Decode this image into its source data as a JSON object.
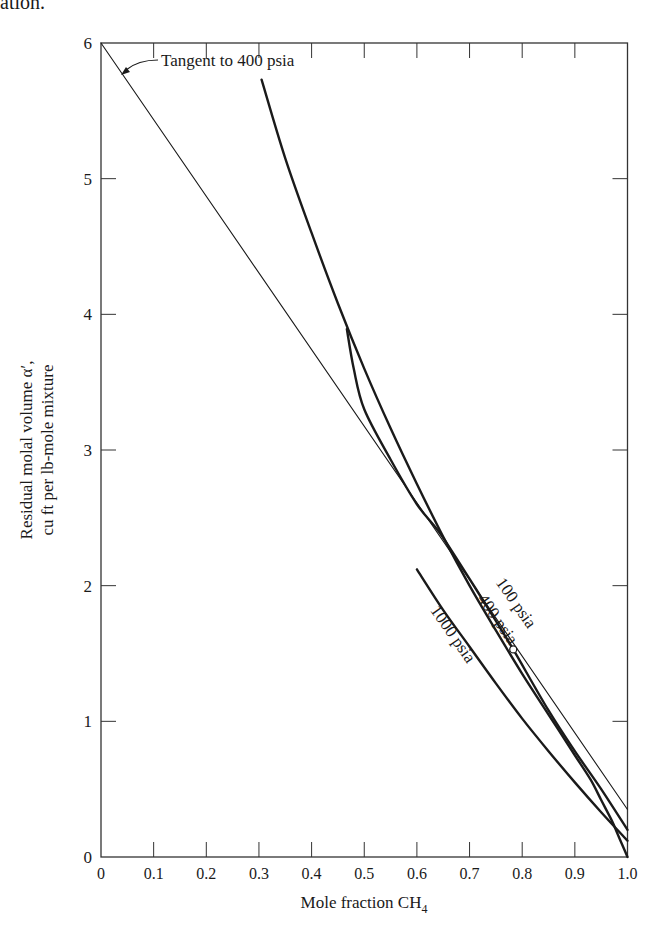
{
  "page": {
    "top_fragment": "ation.",
    "caption_partial": ""
  },
  "chart_data": {
    "type": "line",
    "title": "",
    "xlabel": "Mole fraction CH4",
    "xlabel_main": "Mole fraction CH",
    "xlabel_sub": "4",
    "ylabel": "Residual molal volume α′, cu ft per lb-mole mixture",
    "ylabel_line1": "Residual molal volume α′,",
    "ylabel_line2": "cu ft per lb-mole mixture",
    "xlim": [
      0,
      1.0
    ],
    "ylim": [
      0,
      6
    ],
    "grid": false,
    "legend": "none (curves labeled inline)",
    "x_ticks": [
      "0",
      "0.1",
      "0.2",
      "0.3",
      "0.4",
      "0.5",
      "0.6",
      "0.7",
      "0.8",
      "0.9",
      "1.0"
    ],
    "y_ticks": [
      "0",
      "1",
      "2",
      "3",
      "4",
      "5",
      "6"
    ],
    "series": [
      {
        "name": "100 psia",
        "x": [
          0.305,
          0.35,
          0.4,
          0.45,
          0.5,
          0.55,
          0.6,
          0.65,
          0.7,
          0.75,
          0.8,
          0.85,
          0.9,
          0.93,
          0.95,
          0.97,
          0.98,
          0.99,
          1.0
        ],
        "y": [
          5.73,
          5.15,
          4.6,
          4.08,
          3.6,
          3.16,
          2.75,
          2.36,
          2.0,
          1.67,
          1.35,
          1.05,
          0.75,
          0.57,
          0.42,
          0.27,
          0.18,
          0.09,
          0.0
        ]
      },
      {
        "name": "400 psia",
        "x": [
          0.467,
          0.48,
          0.5,
          0.55,
          0.6,
          0.645,
          0.7,
          0.75,
          0.783,
          0.85,
          0.9,
          0.95,
          1.0
        ],
        "y": [
          3.89,
          3.6,
          3.3,
          2.93,
          2.6,
          2.38,
          2.05,
          1.74,
          1.53,
          1.08,
          0.78,
          0.5,
          0.2
        ]
      },
      {
        "name": "1000 psia",
        "x": [
          0.6,
          0.65,
          0.7,
          0.75,
          0.8,
          0.85,
          0.9,
          0.95,
          1.0
        ],
        "y": [
          2.12,
          1.82,
          1.55,
          1.28,
          1.02,
          0.78,
          0.55,
          0.33,
          0.12
        ]
      },
      {
        "name": "Tangent to 400 psia",
        "style": "thin straight line",
        "x": [
          0.0,
          1.0
        ],
        "y": [
          6.0,
          0.35
        ]
      }
    ],
    "markers": [
      {
        "series": "400 psia",
        "shape": "open-circle",
        "x": 0.783,
        "y": 1.53
      }
    ],
    "annotations": [
      {
        "text": "Tangent to 400 psia",
        "arrow_to": [
          0.045,
          5.75
        ]
      },
      {
        "text": "100 psia",
        "position": [
          0.78,
          1.85
        ],
        "rotation": -55
      },
      {
        "text": "400 psia",
        "position": [
          0.745,
          1.73
        ],
        "rotation": -55
      },
      {
        "text": "1000 psia",
        "position": [
          0.66,
          1.62
        ],
        "rotation": -55
      }
    ]
  }
}
